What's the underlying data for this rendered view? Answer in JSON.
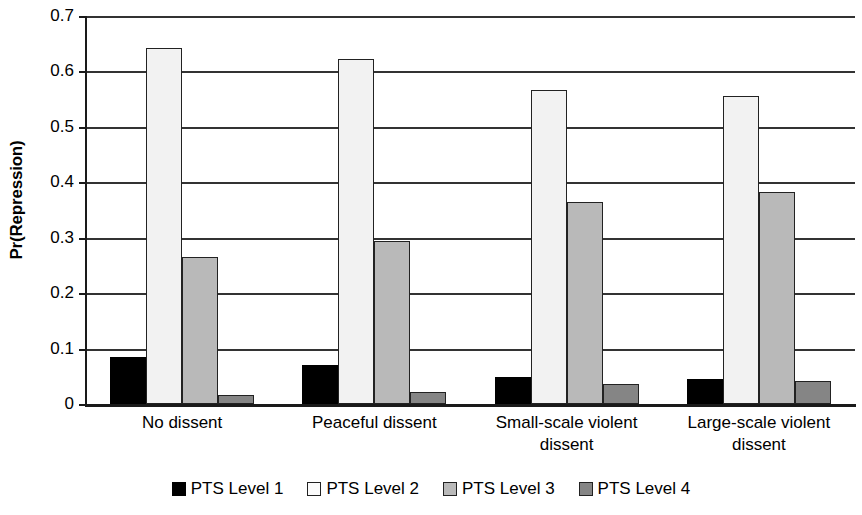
{
  "chart_data": {
    "type": "bar",
    "title": "",
    "xlabel": "",
    "ylabel": "Pr(Repression)",
    "ylim": [
      0,
      0.7
    ],
    "yticks": [
      "0",
      "0.1",
      "0.2",
      "0.3",
      "0.4",
      "0.5",
      "0.6",
      "0.7"
    ],
    "ytick_values": [
      0,
      0.1,
      0.2,
      0.3,
      0.4,
      0.5,
      0.6,
      0.7
    ],
    "grid": true,
    "legend_position": "bottom",
    "categories": [
      "No dissent",
      "Peaceful dissent",
      "Small-scale violent\ndissent",
      "Large-scale violent\ndissent"
    ],
    "series": [
      {
        "name": "PTS Level 1",
        "color": "#000000",
        "values": [
          0.085,
          0.071,
          0.048,
          0.045
        ]
      },
      {
        "name": "PTS Level 2",
        "color": "#f2f2f2",
        "values": [
          0.642,
          0.622,
          0.567,
          0.555
        ]
      },
      {
        "name": "PTS Level 3",
        "color": "#b9b9b9",
        "values": [
          0.265,
          0.295,
          0.365,
          0.382
        ]
      },
      {
        "name": "PTS Level 4",
        "color": "#858585",
        "values": [
          0.017,
          0.022,
          0.037,
          0.041
        ]
      }
    ]
  }
}
